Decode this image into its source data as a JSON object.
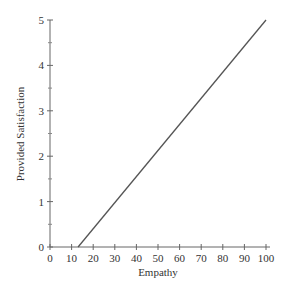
{
  "chart_data": {
    "type": "line",
    "title": "",
    "xlabel": "Empathy",
    "ylabel": "Provided Satisfaction",
    "xlim": [
      0,
      100
    ],
    "ylim": [
      0,
      5
    ],
    "xticks": [
      0,
      10,
      20,
      30,
      40,
      50,
      60,
      70,
      80,
      90,
      100
    ],
    "yticks": [
      0,
      1,
      2,
      3,
      4,
      5
    ],
    "y_minor_ticks": [
      0.5,
      1.5,
      2.5,
      3.5,
      4.5
    ],
    "grid": false,
    "legend": null,
    "series": [
      {
        "name": "Provided Satisfaction",
        "x": [
          13,
          100
        ],
        "y": [
          0,
          5
        ],
        "color": "#555555"
      }
    ]
  }
}
